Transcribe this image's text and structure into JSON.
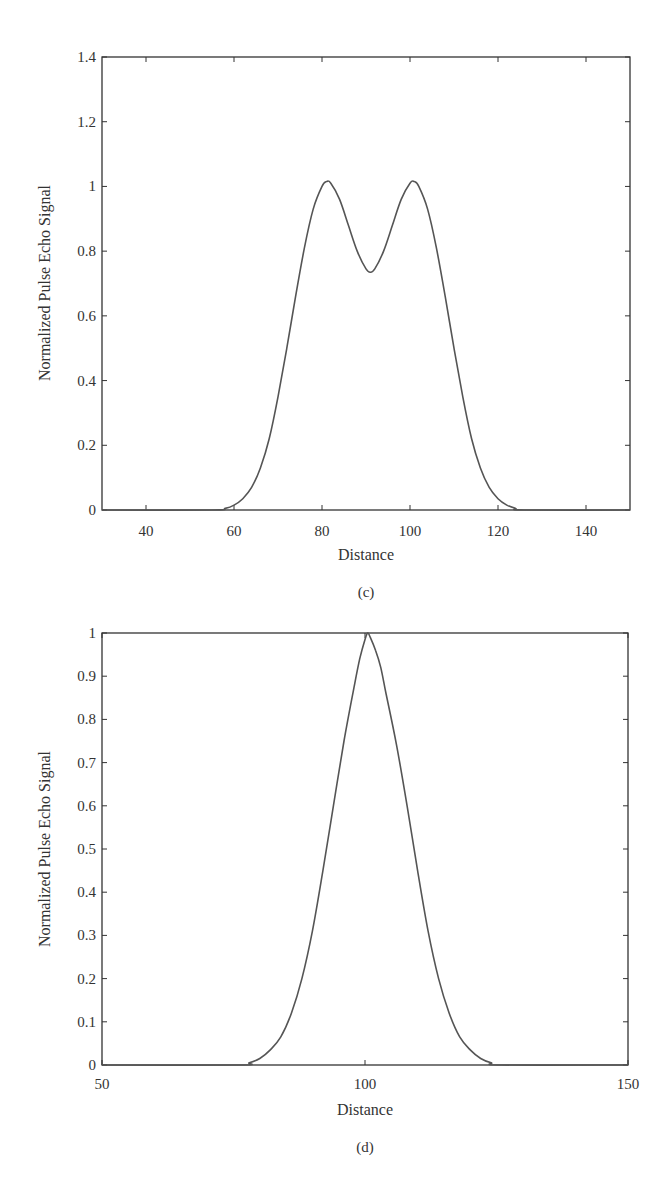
{
  "chart_data": [
    {
      "type": "line",
      "panel_label": "(c)",
      "title": "",
      "xlabel": "Distance",
      "ylabel": "Normalized Pulse Echo Signal",
      "xlim": [
        30,
        150
      ],
      "ylim": [
        0,
        1.4
      ],
      "xticks": [
        40,
        60,
        80,
        100,
        120,
        140
      ],
      "yticks": [
        0,
        0.2,
        0.4,
        0.6,
        0.8,
        1,
        1.2,
        1.4
      ],
      "ytick_labels": [
        "0",
        "0.2",
        "0.4",
        "0.6",
        "0.8",
        "1",
        "1.2",
        "1.4"
      ],
      "grid": false,
      "legend": null,
      "series": [
        {
          "name": "echo",
          "color": "#555555",
          "x": [
            30,
            55,
            58,
            60,
            62,
            64,
            66,
            68,
            70,
            72,
            74,
            76,
            78,
            80,
            81,
            82,
            84,
            86,
            88,
            90,
            91,
            92,
            94,
            96,
            98,
            100,
            101,
            102,
            104,
            106,
            108,
            110,
            112,
            114,
            116,
            118,
            120,
            122,
            124,
            126,
            150
          ],
          "y": [
            0,
            0,
            0.005,
            0.015,
            0.035,
            0.07,
            0.13,
            0.22,
            0.35,
            0.5,
            0.66,
            0.81,
            0.93,
            1.0,
            1.015,
            1.01,
            0.96,
            0.88,
            0.8,
            0.745,
            0.735,
            0.745,
            0.8,
            0.88,
            0.96,
            1.01,
            1.015,
            1.0,
            0.93,
            0.81,
            0.66,
            0.5,
            0.35,
            0.22,
            0.13,
            0.07,
            0.035,
            0.015,
            0.005,
            0,
            0
          ]
        }
      ]
    },
    {
      "type": "line",
      "panel_label": "(d)",
      "title": "",
      "xlabel": "Distance",
      "ylabel": "Normalized Pulse Echo Signal",
      "xlim": [
        50,
        150
      ],
      "ylim": [
        0,
        1
      ],
      "xticks": [
        50,
        100,
        150
      ],
      "yticks": [
        0,
        0.1,
        0.2,
        0.3,
        0.4,
        0.5,
        0.6,
        0.7,
        0.8,
        0.9,
        1
      ],
      "ytick_labels": [
        "0",
        "0.1",
        "0.2",
        "0.3",
        "0.4",
        "0.5",
        "0.6",
        "0.7",
        "0.8",
        "0.9",
        "1"
      ],
      "grid": false,
      "legend": null,
      "series": [
        {
          "name": "echo",
          "color": "#555555",
          "x": [
            50,
            76,
            78,
            80,
            82,
            84,
            86,
            88,
            90,
            92,
            94,
            96,
            98,
            99,
            100,
            100.5,
            101,
            102,
            103,
            104,
            106,
            108,
            110,
            112,
            114,
            116,
            118,
            120,
            122,
            124,
            126,
            150
          ],
          "y": [
            0,
            0,
            0.005,
            0.015,
            0.035,
            0.065,
            0.12,
            0.2,
            0.31,
            0.45,
            0.6,
            0.75,
            0.88,
            0.94,
            0.985,
            1.0,
            0.99,
            0.96,
            0.92,
            0.86,
            0.74,
            0.6,
            0.45,
            0.31,
            0.2,
            0.12,
            0.065,
            0.035,
            0.015,
            0.005,
            0,
            0
          ]
        }
      ]
    }
  ],
  "panels": [
    {
      "caption": "(c)",
      "xlabel": "Distance",
      "ylabel": "Normalized Pulse Echo Signal"
    },
    {
      "caption": "(d)",
      "xlabel": "Distance",
      "ylabel": "Normalized Pulse Echo Signal"
    }
  ]
}
